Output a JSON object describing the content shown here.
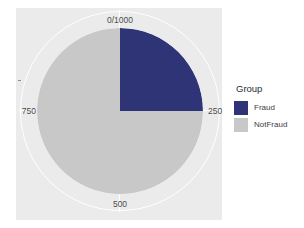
{
  "chart_data": {
    "type": "pie",
    "title": "",
    "subtitle": "",
    "xlabel": "",
    "ylabel": "",
    "categories": [
      "Fraud",
      "NotFraud"
    ],
    "values": [
      250,
      750
    ],
    "total": 1000,
    "percentages": [
      25,
      75
    ],
    "colors": [
      "#2e3475",
      "#c8c8c8"
    ],
    "legend": {
      "title": "Group",
      "position": "right",
      "entries": [
        {
          "label": "Fraud",
          "color": "#2e3475",
          "value": 250
        },
        {
          "label": "NotFraud",
          "color": "#c8c8c8",
          "value": 750
        }
      ]
    },
    "axis": {
      "type": "polar",
      "direction": "clockwise",
      "start_angle_deg": 0,
      "range": [
        0,
        1000
      ],
      "tick_labels": [
        "0/1000",
        "250",
        "500",
        "750"
      ],
      "tick_values": [
        0,
        250,
        500,
        750
      ],
      "tick_positions": [
        "top",
        "right",
        "bottom",
        "left"
      ],
      "grid": true
    },
    "panel_background": "#ebebeb",
    "grid_color": "#ffffff",
    "plot_background": "#ffffff"
  },
  "axis_labels": {
    "top": "0/1000",
    "right": "250",
    "bottom": "500",
    "left": "750"
  },
  "legend": {
    "title": "Group",
    "items": [
      {
        "label": "Fraud"
      },
      {
        "label": "NotFraud"
      }
    ]
  },
  "geometry": {
    "panel": {
      "left": 16,
      "top": 8,
      "width": 206,
      "height": 212
    },
    "pie": {
      "cx": 104,
      "cy": 103,
      "r": 83
    }
  }
}
